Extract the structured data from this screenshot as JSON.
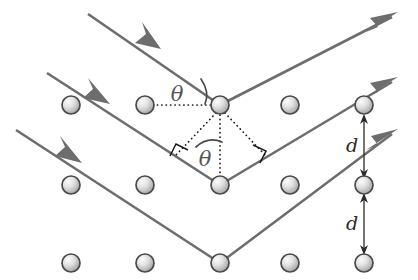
{
  "figure": {
    "background_color": "#ffffff",
    "width": 418,
    "height": 280
  },
  "colors": {
    "ray": "#6d6d6d",
    "construction": "#1a1a1a",
    "atom_stroke": "#4a4a4a",
    "atom_fill_light": "#f2f2f2",
    "atom_fill_dark": "#9a9a9a",
    "label": "#555555",
    "dimension": "#2a2a2a"
  },
  "labels": {
    "theta_upper": "θ",
    "theta_lower": "θ",
    "spacing_upper": "d",
    "spacing_lower": "d"
  },
  "lattice": {
    "columns_x": [
      71,
      145,
      220,
      290,
      364
    ],
    "rows_y": [
      105,
      185,
      263
    ],
    "atom_radius": 9,
    "atoms": [
      {
        "id": "atom-r0-c0",
        "x": 71,
        "y": 105
      },
      {
        "id": "atom-r0-c1",
        "x": 145,
        "y": 105
      },
      {
        "id": "atom-r0-c2",
        "x": 220,
        "y": 105
      },
      {
        "id": "atom-r0-c3",
        "x": 290,
        "y": 105
      },
      {
        "id": "atom-r0-c4",
        "x": 364,
        "y": 105
      },
      {
        "id": "atom-r1-c0",
        "x": 71,
        "y": 185
      },
      {
        "id": "atom-r1-c1",
        "x": 145,
        "y": 185
      },
      {
        "id": "atom-r1-c2",
        "x": 220,
        "y": 185
      },
      {
        "id": "atom-r1-c3",
        "x": 290,
        "y": 185
      },
      {
        "id": "atom-r1-c4",
        "x": 364,
        "y": 185
      },
      {
        "id": "atom-r2-c0",
        "x": 71,
        "y": 263
      },
      {
        "id": "atom-r2-c1",
        "x": 145,
        "y": 263
      },
      {
        "id": "atom-r2-c2",
        "x": 220,
        "y": 263
      },
      {
        "id": "atom-r2-c3",
        "x": 290,
        "y": 263
      },
      {
        "id": "atom-r2-c4",
        "x": 364,
        "y": 263
      }
    ]
  },
  "rays": [
    {
      "id": "ray-top",
      "incident_start": [
        88,
        14
      ],
      "vertex": [
        220,
        105
      ],
      "reflected_end": [
        397,
        13
      ],
      "incident_arrow_at": [
        152,
        44
      ],
      "reflected_arrow_at": [
        397,
        13
      ]
    },
    {
      "id": "ray-middle",
      "incident_start": [
        47,
        73
      ],
      "vertex": [
        220,
        185
      ],
      "reflected_end": [
        397,
        78
      ],
      "incident_arrow_at": [
        100,
        98
      ],
      "reflected_arrow_at": [
        397,
        78
      ]
    },
    {
      "id": "ray-bottom",
      "incident_start": [
        16,
        130
      ],
      "vertex": [
        220,
        263
      ],
      "reflected_end": [
        397,
        130
      ],
      "incident_arrow_at": [
        72,
        156
      ],
      "reflected_arrow_at": [
        397,
        130
      ]
    }
  ],
  "construction": {
    "horizontal_dotted": {
      "from": [
        152,
        105
      ],
      "to": [
        215,
        105
      ]
    },
    "vertical_dotted": {
      "from": [
        220,
        114
      ],
      "to": [
        220,
        176
      ]
    },
    "left_perp_dotted": {
      "from": [
        218,
        112
      ],
      "to": [
        176,
        155
      ]
    },
    "right_perp_dotted": {
      "from": [
        224,
        112
      ],
      "to": [
        264,
        155
      ]
    }
  },
  "angle_marks": [
    {
      "id": "theta-upper",
      "label_x": 181,
      "label_y": 99,
      "arc_from": [
        202,
        80
      ],
      "arc_to": [
        206,
        102
      ]
    },
    {
      "id": "theta-lower",
      "label_x": 204,
      "label_y": 163,
      "arc_from": [
        197,
        145
      ],
      "arc_to": [
        222,
        140
      ]
    }
  ],
  "right_angles": [
    {
      "id": "right-angle-left",
      "points": "171,155 176,144 187,149"
    },
    {
      "id": "right-angle-right",
      "points": "254,146 265,151 260,162"
    }
  ],
  "dimensions": [
    {
      "id": "spacing-d-upper",
      "label": "d",
      "label_x": 353,
      "label_y": 152,
      "from": [
        364,
        178
      ],
      "to": [
        364,
        114
      ]
    },
    {
      "id": "spacing-d-lower",
      "label": "d",
      "label_x": 353,
      "label_y": 230,
      "from": [
        364,
        194
      ],
      "to": [
        364,
        254
      ]
    }
  ]
}
